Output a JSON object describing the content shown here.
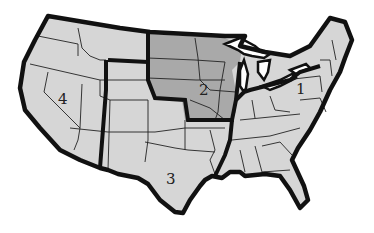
{
  "map": {
    "title": "United States regions map",
    "regions": [
      {
        "id": "1",
        "label": "1",
        "name": "Northeast and Southeast",
        "color": "#d6d6d6"
      },
      {
        "id": "2",
        "label": "2",
        "name": "Upper Midwest",
        "color": "#a9a9a9"
      },
      {
        "id": "3",
        "label": "3",
        "name": "Southwest / South Central",
        "color": "#d6d6d6"
      },
      {
        "id": "4",
        "label": "4",
        "name": "West",
        "color": "#d6d6d6"
      }
    ],
    "colors": {
      "background": "#ffffff",
      "land_light": "#d6d6d6",
      "land_dark": "#a9a9a9",
      "border": "#111111"
    }
  }
}
